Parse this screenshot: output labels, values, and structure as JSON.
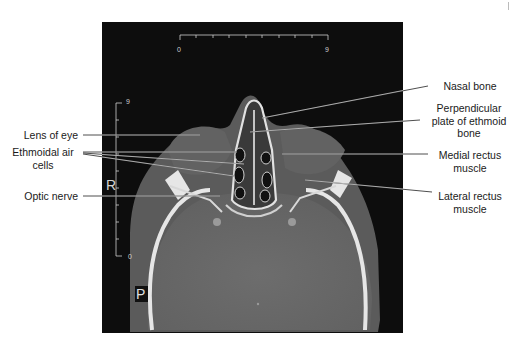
{
  "figure": {
    "type": "axial CT scan",
    "orientation_markers": {
      "right": "R",
      "posterior": "P"
    },
    "scale_bars": {
      "horizontal": {
        "start": "0",
        "end": "9"
      },
      "vertical": {
        "top": "9",
        "bottom": "0"
      }
    }
  },
  "labels": {
    "left": [
      {
        "id": "lens",
        "text": "Lens of eye"
      },
      {
        "id": "ethmoid_cells",
        "line1": "Ethmoidal air",
        "line2": "cells"
      },
      {
        "id": "optic_nerve",
        "text": "Optic nerve"
      }
    ],
    "right": [
      {
        "id": "nasal_bone",
        "text": "Nasal bone"
      },
      {
        "id": "perpendicular_plate",
        "line1": "Perpendicular",
        "line2": "plate of ethmoid",
        "line3": "bone"
      },
      {
        "id": "medial_rectus",
        "line1": "Medial rectus",
        "line2": "muscle"
      },
      {
        "id": "lateral_rectus",
        "line1": "Lateral rectus",
        "line2": "muscle"
      }
    ]
  },
  "colors": {
    "background": "#ffffff",
    "scan_background": "#0d0d0d",
    "soft_tissue": "#5f5f5f",
    "brain": "#6a6a6a",
    "bone": "#e8e8e8",
    "leader_line": "#3a3a3a"
  }
}
